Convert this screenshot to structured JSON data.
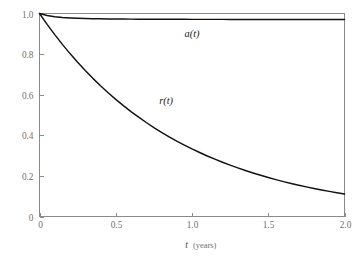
{
  "chart_data": {
    "type": "line",
    "title": "",
    "subtitle": "",
    "xlabel_variable": "t",
    "xlabel_unit": "(years)",
    "ylabel": "",
    "xlim": [
      0,
      2.0
    ],
    "ylim": [
      0,
      1.0
    ],
    "grid": false,
    "legend_position": "inline-curve-labels",
    "x_ticks": [
      "0",
      "0.5",
      "1.0",
      "1.5",
      "2.0"
    ],
    "x_tick_values": [
      0,
      0.5,
      1.0,
      1.5,
      2.0
    ],
    "y_ticks": [
      "0",
      "0.2",
      "0.4",
      "0.6",
      "0.8",
      "1.0"
    ],
    "y_tick_values": [
      0,
      0.2,
      0.4,
      0.6,
      0.8,
      1.0
    ],
    "x": [
      0,
      0.05,
      0.1,
      0.15,
      0.2,
      0.25,
      0.3,
      0.35,
      0.4,
      0.45,
      0.5,
      0.55,
      0.6,
      0.65,
      0.7,
      0.75,
      0.8,
      0.85,
      0.9,
      0.95,
      1.0,
      1.05,
      1.1,
      1.15,
      1.2,
      1.25,
      1.3,
      1.35,
      1.4,
      1.45,
      1.5,
      1.55,
      1.6,
      1.65,
      1.7,
      1.75,
      1.8,
      1.85,
      1.9,
      1.95,
      2.0
    ],
    "series": [
      {
        "name": "a(t)",
        "label": "a(t)",
        "color": "#15110f",
        "label_x": 1.0,
        "label_y": 0.885,
        "values": [
          1.0,
          0.9903,
          0.9843,
          0.9805,
          0.9781,
          0.9764,
          0.9753,
          0.9744,
          0.9738,
          0.9733,
          0.9729,
          0.9726,
          0.9723,
          0.9721,
          0.9719,
          0.9717,
          0.9716,
          0.9715,
          0.9714,
          0.9713,
          0.9712,
          0.9711,
          0.9711,
          0.971,
          0.971,
          0.9709,
          0.9709,
          0.9708,
          0.9708,
          0.9708,
          0.9707,
          0.9707,
          0.9707,
          0.9707,
          0.9706,
          0.9706,
          0.9706,
          0.9706,
          0.9706,
          0.9705,
          0.9705
        ]
      },
      {
        "name": "r(t)",
        "label": "r(t)",
        "color": "#15110f",
        "label_x": 0.83,
        "label_y": 0.555,
        "values": [
          1.0,
          0.9464,
          0.8958,
          0.8479,
          0.8025,
          0.7596,
          0.719,
          0.6805,
          0.6441,
          0.6097,
          0.5771,
          0.5462,
          0.5169,
          0.4893,
          0.4631,
          0.4383,
          0.4148,
          0.3926,
          0.3716,
          0.3517,
          0.3329,
          0.3151,
          0.2982,
          0.2823,
          0.2671,
          0.2528,
          0.2393,
          0.2265,
          0.2144,
          0.2029,
          0.1921,
          0.1818,
          0.172,
          0.1628,
          0.1541,
          0.1459,
          0.138,
          0.1306,
          0.1236,
          0.117,
          0.1108
        ]
      }
    ],
    "model_notes": {
      "a_description": "a(t) decays rapidly from 1.0 then plateaus near 0.97",
      "r_description": "r(t) exponential decay, approximately exp(-1.1*t), reaching about 0.11 at t=2.0"
    }
  },
  "style": {
    "background": "#ffffff",
    "axis_color": "#8a8a8a",
    "tick_label_color": "#6f6f6f",
    "curve_color": "#15110f"
  }
}
